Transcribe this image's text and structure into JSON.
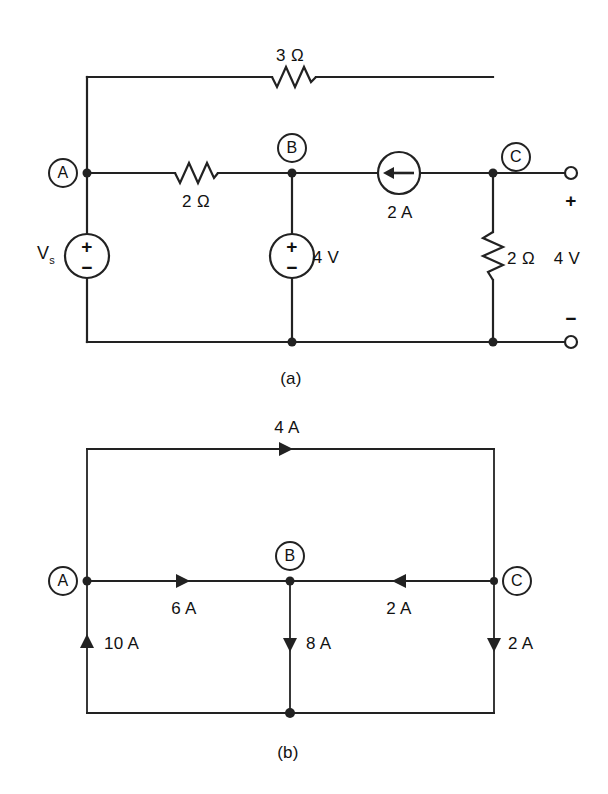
{
  "figure": {
    "background_color": "#ffffff",
    "line_color": "#222222",
    "captions": {
      "a": "(a)",
      "b": "(b)"
    }
  },
  "circuit_a": {
    "caption": "(a)",
    "nodes": [
      {
        "id": "A",
        "label": "A"
      },
      {
        "id": "B",
        "label": "B"
      },
      {
        "id": "C",
        "label": "C"
      }
    ],
    "components": {
      "top_resistor": {
        "name": "3-ohm-resistor",
        "label": "3 Ω",
        "value": 3,
        "unit": "Ω"
      },
      "series_resistor": {
        "name": "2-ohm-resistor-ab",
        "label": "2 Ω",
        "value": 2,
        "unit": "Ω"
      },
      "load_resistor": {
        "name": "2-ohm-resistor-load",
        "label": "2 Ω",
        "value": 2,
        "unit": "Ω"
      },
      "source_vs": {
        "name": "voltage-source-vs",
        "label": "V",
        "subscript": "s",
        "plus": "+",
        "minus": "−"
      },
      "source_4v": {
        "name": "voltage-source-4v",
        "label": "4 V",
        "value": 4,
        "unit": "V",
        "plus": "+",
        "minus": "−"
      },
      "current_source": {
        "name": "current-source-2a",
        "label": "2 A",
        "value": 2,
        "unit": "A",
        "direction": "left"
      }
    },
    "output_port": {
      "voltage_label": "4 V",
      "plus": "+",
      "minus": "−"
    }
  },
  "circuit_b": {
    "caption": "(b)",
    "nodes": [
      {
        "id": "A",
        "label": "A"
      },
      {
        "id": "B",
        "label": "B"
      },
      {
        "id": "C",
        "label": "C"
      }
    ],
    "currents": [
      {
        "name": "branch-top",
        "label": "4 A",
        "value": 4,
        "unit": "A",
        "direction": "right"
      },
      {
        "name": "branch-ab",
        "label": "6 A",
        "value": 6,
        "unit": "A",
        "direction": "right"
      },
      {
        "name": "branch-cb",
        "label": "2 A",
        "value": 2,
        "unit": "A",
        "direction": "left"
      },
      {
        "name": "branch-left",
        "label": "10 A",
        "value": 10,
        "unit": "A",
        "direction": "up"
      },
      {
        "name": "branch-middle",
        "label": "8 A",
        "value": 8,
        "unit": "A",
        "direction": "down"
      },
      {
        "name": "branch-right",
        "label": "2 A",
        "value": 2,
        "unit": "A",
        "direction": "down"
      }
    ]
  }
}
